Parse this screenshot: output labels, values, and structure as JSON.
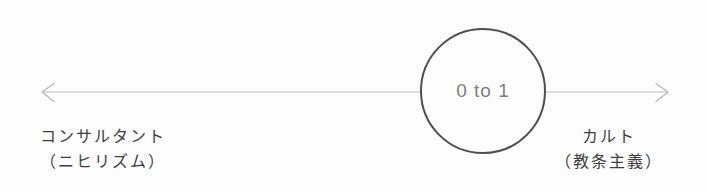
{
  "diagram": {
    "center_label": "0 to 1",
    "left_pole": {
      "title": "コンサルタント",
      "subtitle": "（ニヒリズム）"
    },
    "right_pole": {
      "title": "カルト",
      "subtitle": "（教条主義）"
    },
    "colors": {
      "background": "#fdfdfd",
      "axis_line": "#bcbcbc",
      "circle_stroke": "#4f4f4f",
      "circle_label": "#7e7e7e",
      "pole_text": "#3e3e3e"
    }
  }
}
